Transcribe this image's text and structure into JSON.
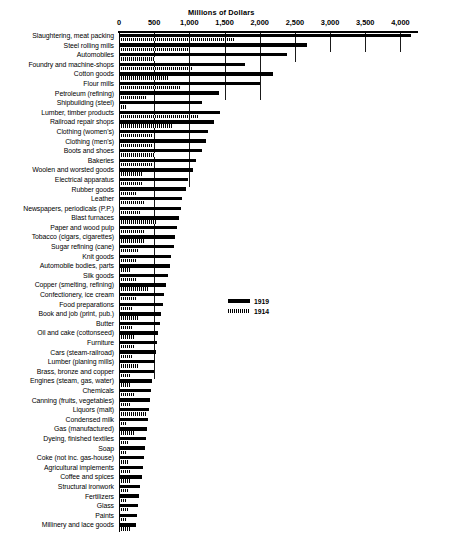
{
  "chart_data": {
    "type": "bar",
    "orientation": "horizontal",
    "title": "Millions of Dollars",
    "xlabel": "Millions of Dollars",
    "ylabel": "",
    "xlim": [
      0,
      4250
    ],
    "xticks": [
      0,
      500,
      1000,
      1500,
      2000,
      2500,
      3000,
      3500,
      4000
    ],
    "xtick_labels": [
      "0",
      "500",
      "1,000",
      "1,500",
      "2,000",
      "2,500",
      "3,000",
      "3,500",
      "4,000"
    ],
    "grid": true,
    "grid_axis": "x",
    "legend_position": "middle-right",
    "categories": [
      "Slaughtering, meat packing",
      "Steel rolling mills",
      "Automobiles",
      "Foundry and machine-shops",
      "Cotton goods",
      "Flour mills",
      "Petroleum (refining)",
      "Shipbuilding (steel)",
      "Lumber, timber products",
      "Railroad repair shops",
      "Clothing (women's)",
      "Clothing (men's)",
      "Boots and shoes",
      "Bakeries",
      "Woolen and worsted goods",
      "Electrical apparatus",
      "Rubber goods",
      "Leather",
      "Newspapers, periodicals (P.P.)",
      "Blast furnaces",
      "Paper and wood pulp",
      "Tobacco (cigars, cigarettes)",
      "Sugar refining (cane)",
      "Knit goods",
      "Automobile bodies, parts",
      "Silk goods",
      "Copper (smelting, refining)",
      "Confectionery, ice cream",
      "Food preparations",
      "Book and job (print, pub.)",
      "Butter",
      "Oil and cake (cottonseed)",
      "Furniture",
      "Cars (steam-railroad)",
      "Lumber (planing mills)",
      "Brass, bronze and copper",
      "Engines (steam, gas, water)",
      "Chemicals",
      "Canning (fruits, vegetables)",
      "Liquors (malt)",
      "Condensed milk",
      "Gas (manufactured)",
      "Dyeing, finished textiles",
      "Soap",
      "Coke (not inc. gas-house)",
      "Agricultural implements",
      "Coffee and spices",
      "Structural ironwork",
      "Fertilizers",
      "Glass",
      "Paints",
      "Millinery and lace goods"
    ],
    "series": [
      {
        "name": "1919",
        "color": "#000000",
        "pattern": "solid",
        "values": [
          4150,
          2675,
          2385,
          1795,
          2190,
          2010,
          1420,
          1185,
          1435,
          1350,
          1270,
          1235,
          1175,
          1100,
          1055,
          975,
          955,
          900,
          875,
          850,
          830,
          800,
          785,
          745,
          720,
          690,
          665,
          640,
          620,
          600,
          580,
          560,
          540,
          525,
          510,
          495,
          470,
          455,
          440,
          425,
          410,
          395,
          380,
          365,
          350,
          335,
          320,
          305,
          290,
          275,
          260,
          245
        ]
      },
      {
        "name": "1914",
        "color": "#000000",
        "pattern": "hatched",
        "values": [
          1650,
          1020,
          505,
          1050,
          700,
          880,
          390,
          95,
          1130,
          760,
          470,
          485,
          510,
          490,
          325,
          340,
          260,
          360,
          310,
          530,
          355,
          365,
          290,
          245,
          175,
          255,
          425,
          250,
          200,
          265,
          190,
          210,
          215,
          180,
          290,
          170,
          160,
          215,
          150,
          400,
          95,
          230,
          145,
          120,
          135,
          155,
          165,
          130,
          105,
          125,
          110,
          150
        ]
      }
    ]
  },
  "legend": {
    "items": [
      {
        "label": "1919",
        "swatch": "solid-black"
      },
      {
        "label": "1914",
        "swatch": "hatched"
      }
    ]
  },
  "caption": {
    "text": ""
  }
}
